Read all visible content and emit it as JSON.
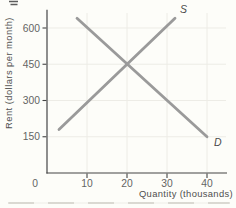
{
  "figure": {
    "y_axis_title": "Rent (dollars per month)",
    "x_axis_title": "Quantity (thousands)"
  },
  "chart_data": {
    "type": "line",
    "title": "",
    "xlabel": "Quantity (thousands)",
    "ylabel": "Rent (dollars per month)",
    "xlim": [
      0,
      45
    ],
    "ylim": [
      0,
      675
    ],
    "x_ticks": [
      0,
      10,
      20,
      30,
      40
    ],
    "y_ticks": [
      150,
      300,
      450,
      600
    ],
    "grid": true,
    "legend_position": "none",
    "series": [
      {
        "name": "S",
        "role": "supply",
        "points": [
          [
            3,
            180
          ],
          [
            32,
            640
          ]
        ],
        "label_offset": [
          5,
          -5
        ]
      },
      {
        "name": "D",
        "role": "demand",
        "points": [
          [
            7.5,
            640
          ],
          [
            40,
            150
          ]
        ],
        "label_offset": [
          7,
          9
        ]
      }
    ],
    "equilibrium": {
      "quantity": 20,
      "rent": 450
    }
  },
  "colors": {
    "background": "#fdfdf9",
    "curve": "#9a9a9a",
    "curve_label": "#4a4a4a",
    "axis": "#454545",
    "tick_label": "#646464",
    "axis_title": "#4f4f4f",
    "grid": "#edece6"
  }
}
